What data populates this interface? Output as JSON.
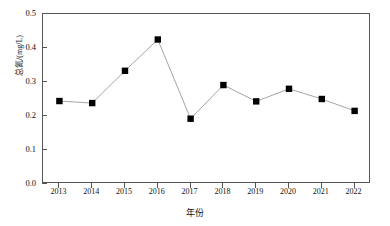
{
  "chart_data": {
    "type": "line",
    "title": "",
    "xlabel": "年份",
    "ylabel": "总氮/(mg/L)",
    "categories": [
      "2013",
      "2014",
      "2015",
      "2016",
      "2017",
      "2018",
      "2019",
      "2020",
      "2021",
      "2022"
    ],
    "values": [
      0.244,
      0.238,
      0.333,
      0.425,
      0.192,
      0.291,
      0.243,
      0.28,
      0.25,
      0.215
    ],
    "series": [
      {
        "name": "总氮",
        "values": [
          0.244,
          0.238,
          0.333,
          0.425,
          0.192,
          0.291,
          0.243,
          0.28,
          0.25,
          0.215
        ]
      }
    ],
    "ylim": [
      0.0,
      0.5
    ],
    "yticks": [
      "0.0",
      "0.1",
      "0.2",
      "0.3",
      "0.4",
      "0.5"
    ],
    "ytick_values": [
      0.0,
      0.1,
      0.2,
      0.3,
      0.4,
      0.5
    ],
    "xticks": [
      "2013",
      "2014",
      "2015",
      "2016",
      "2017",
      "2018",
      "2019",
      "2020",
      "2021",
      "2022"
    ],
    "grid": false,
    "legend": false,
    "marker": "filled-square",
    "marker_color": "#000000",
    "line_color": "#9a9a9a",
    "axis_color": "#555555",
    "background": "#ffffff"
  }
}
